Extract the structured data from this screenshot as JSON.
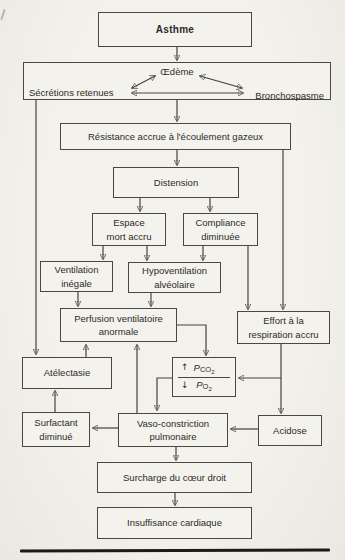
{
  "page": {
    "background": "#f1efe9",
    "ink": "#45433e"
  },
  "nodes": {
    "asthme": {
      "label": "Asthme"
    },
    "oedeme": {
      "label": "Œdème"
    },
    "secretions_retenues": {
      "label": "Sécrétions retenues"
    },
    "bronchospasme": {
      "label": "Bronchospasme"
    },
    "resistance": {
      "label": "Résistance accrue à l'écoulement gazeux"
    },
    "distension": {
      "label": "Distension"
    },
    "espace_mort": {
      "label": "Espace\nmort accru"
    },
    "compliance": {
      "label": "Compliance\ndiminuée"
    },
    "ventilation_inegale": {
      "label": "Ventilation\ninégale"
    },
    "hypoventilation": {
      "label": "Hypoventilation\nalvéolaire"
    },
    "perfusion": {
      "label": "Perfusion ventilatoire\nanormale"
    },
    "effort": {
      "label": "Effort à la\nrespiration accru"
    },
    "atelectasie": {
      "label": "Atélectasie"
    },
    "gaz": {
      "pco2_arrow": "↑",
      "pco2_symbol": "P",
      "pco2_gas": "CO",
      "pco2_sub": "2",
      "po2_arrow": "↓",
      "po2_symbol": "P",
      "po2_gas": "O",
      "po2_sub": "2"
    },
    "surfactant": {
      "label": "Surfactant\ndiminué"
    },
    "vasoconstriction": {
      "label": "Vaso-constriction\npulmonaire"
    },
    "acidose": {
      "label": "Acidose"
    },
    "surcharge": {
      "label": "Surcharge du cœur droit"
    },
    "insuffisance": {
      "label": "Insuffisance cardiaque"
    }
  },
  "edges": [
    {
      "from": "Asthme",
      "to": "Œdème / Sécrétions retenues / Bronchospasme"
    },
    {
      "from": "Œdème",
      "to": "Sécrétions retenues",
      "bidirectional": true
    },
    {
      "from": "Œdème",
      "to": "Bronchospasme",
      "bidirectional": true
    },
    {
      "from": "Sécrétions retenues",
      "to": "Bronchospasme",
      "bidirectional": true
    },
    {
      "from": "Œdème / Sécrétions retenues / Bronchospasme",
      "to": "Résistance accrue à l'écoulement gazeux"
    },
    {
      "from": "Sécrétions retenues",
      "to": "Atélectasie"
    },
    {
      "from": "Résistance accrue à l'écoulement gazeux",
      "to": "Distension"
    },
    {
      "from": "Résistance accrue à l'écoulement gazeux",
      "to": "Effort à la respiration accru"
    },
    {
      "from": "Distension",
      "to": "Espace mort accru"
    },
    {
      "from": "Distension",
      "to": "Compliance diminuée"
    },
    {
      "from": "Espace mort accru",
      "to": "Ventilation inégale"
    },
    {
      "from": "Espace mort accru",
      "to": "Hypoventilation alvéolaire"
    },
    {
      "from": "Compliance diminuée",
      "to": "Hypoventilation alvéolaire"
    },
    {
      "from": "Compliance diminuée",
      "to": "Effort à la respiration accru"
    },
    {
      "from": "Ventilation inégale",
      "to": "Perfusion ventilatoire anormale"
    },
    {
      "from": "Hypoventilation alvéolaire",
      "to": "Perfusion ventilatoire anormale"
    },
    {
      "from": "Atélectasie",
      "to": "Perfusion ventilatoire anormale"
    },
    {
      "from": "Vaso-constriction pulmonaire",
      "to": "Perfusion ventilatoire anormale"
    },
    {
      "from": "Perfusion ventilatoire anormale",
      "to": "↑PCO2 / ↓PO2"
    },
    {
      "from": "Effort à la respiration accru",
      "to": "↑PCO2 / ↓PO2"
    },
    {
      "from": "Effort à la respiration accru",
      "to": "Acidose"
    },
    {
      "from": "↑PCO2 / ↓PO2",
      "to": "Vaso-constriction pulmonaire"
    },
    {
      "from": "Acidose",
      "to": "Vaso-constriction pulmonaire"
    },
    {
      "from": "Vaso-constriction pulmonaire",
      "to": "Surfactant diminué"
    },
    {
      "from": "Surfactant diminué",
      "to": "Atélectasie"
    },
    {
      "from": "Vaso-constriction pulmonaire",
      "to": "Surcharge du cœur droit"
    },
    {
      "from": "Surcharge du cœur droit",
      "to": "Insuffisance cardiaque"
    }
  ]
}
